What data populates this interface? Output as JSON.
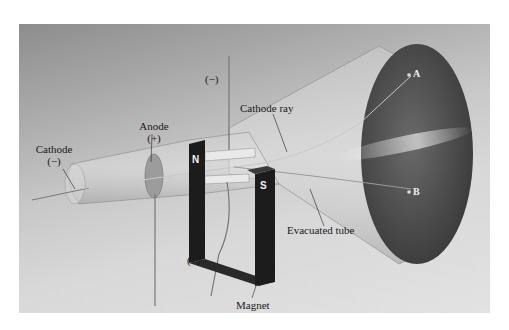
{
  "figure": {
    "labels": {
      "cathode": "Cathode",
      "cathode_sign": "(−)",
      "anode": "Anode",
      "anode_sign": "(+)",
      "top_electrode_sign": "(−)",
      "bottom_electrode_sign": "(+)",
      "cathode_ray": "Cathode ray",
      "evacuated_tube": "Evacuated tube",
      "magnet": "Magnet",
      "magnet_north": "N",
      "magnet_south": "S",
      "point_a": "A",
      "point_b": "B"
    },
    "colors": {
      "background_dark": "#8d8d8d",
      "background_light": "#e2e2e2",
      "magnet": "#1c1c1c",
      "screen": "#4a4a4a",
      "text": "#1a1a1a"
    }
  }
}
